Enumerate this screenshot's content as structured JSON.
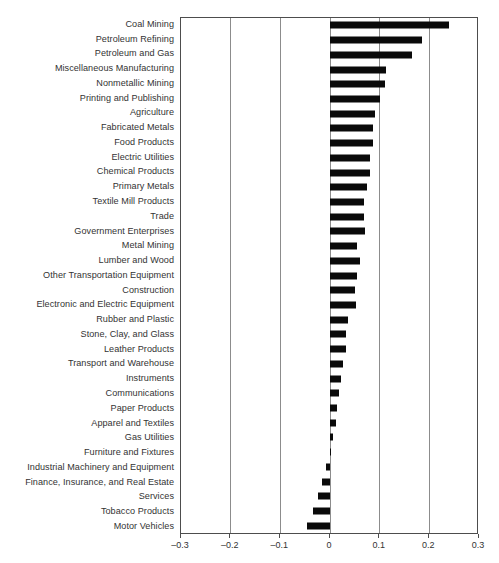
{
  "chart_data": {
    "type": "bar",
    "orientation": "horizontal",
    "title": "",
    "subtitle": "",
    "xlabel": "",
    "ylabel": "",
    "xlim": [
      -0.3,
      0.3
    ],
    "xticks": [
      -0.3,
      -0.2,
      -0.1,
      0,
      0.1,
      0.2,
      0.3
    ],
    "xtick_labels": [
      "–0.3",
      "–0.2",
      "–0.1",
      "0",
      "0.1",
      "0.2",
      "0.3"
    ],
    "grid": "vertical",
    "legend": "none",
    "bar_color": "#0a0a0a",
    "categories": [
      "Coal Mining",
      "Petroleum Refining",
      "Petroleum and Gas",
      "Miscellaneous Manufacturing",
      "Nonmetallic Mining",
      "Printing and Publishing",
      "Agriculture",
      "Fabricated Metals",
      "Food Products",
      "Electric Utilities",
      "Chemical Products",
      "Primary Metals",
      "Textile Mill Products",
      "Trade",
      "Government Enterprises",
      "Metal Mining",
      "Lumber and Wood",
      "Other Transportation Equipment",
      "Construction",
      "Electronic and Electric Equipment",
      "Rubber and Plastic",
      "Stone, Clay, and Glass",
      "Leather Products",
      "Transport and Warehouse",
      "Instruments",
      "Communications",
      "Paper Products",
      "Apparel and Textiles",
      "Gas Utilities",
      "Furniture and Fixtures",
      "Industrial Machinery and Equipment",
      "Finance, Insurance, and Real Estate",
      "Services",
      "Tobacco Products",
      "Motor Vehicles"
    ],
    "values": [
      0.24,
      0.185,
      0.165,
      0.112,
      0.11,
      0.1,
      0.09,
      0.087,
      0.086,
      0.08,
      0.08,
      0.075,
      0.069,
      0.068,
      0.07,
      0.055,
      0.06,
      0.055,
      0.051,
      0.053,
      0.037,
      0.032,
      0.033,
      0.026,
      0.022,
      0.019,
      0.014,
      0.012,
      0.007,
      0.002,
      -0.008,
      -0.017,
      -0.024,
      -0.035,
      -0.047
    ]
  }
}
